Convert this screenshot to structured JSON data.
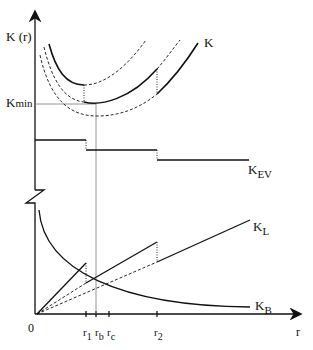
{
  "diagram": {
    "y_axis_label": "K (r)",
    "x_axis_label": "r",
    "origin_label": "0",
    "kmin_label": {
      "main": "K",
      "sub": "min"
    },
    "curve_labels": {
      "K": "K",
      "K_EV": {
        "main": "K",
        "sub": "EV"
      },
      "K_L": {
        "main": "K",
        "sub": "L"
      },
      "K_B": {
        "main": "K",
        "sub": "B"
      }
    },
    "x_ticks": [
      {
        "main": "r",
        "sub": "1"
      },
      {
        "main": "r",
        "sub": "b"
      },
      {
        "main": "r",
        "sub": "c"
      },
      {
        "main": "r",
        "sub": "2"
      }
    ],
    "colors": {
      "line": "#111111",
      "guide": "#888888"
    }
  }
}
